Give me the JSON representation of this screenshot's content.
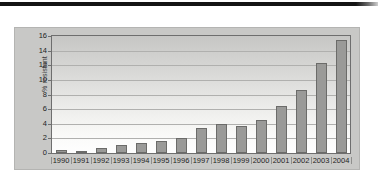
{
  "figure": {
    "panel_bg": "#c8c8c6",
    "bar_fill": "#9a9a98",
    "bar_stroke": "#6b6b69",
    "frame_stroke": "#6e6e6e",
    "grid_color": "#b0b0ae",
    "rule_color": "#141414"
  },
  "chart_data": {
    "type": "bar",
    "title": "",
    "xlabel": "",
    "ylabel": "% resistant",
    "categories": [
      "1990",
      "1991",
      "1992",
      "1993",
      "1994",
      "1995",
      "1996",
      "1997",
      "1998",
      "1999",
      "2000",
      "2001",
      "2002",
      "2003",
      "2004"
    ],
    "values": [
      0.4,
      0.3,
      0.65,
      1.15,
      1.4,
      1.6,
      2.1,
      3.4,
      3.9,
      3.75,
      4.5,
      6.4,
      8.6,
      12.3,
      15.4
    ],
    "ylim": [
      0,
      16
    ],
    "yticks": [
      0,
      2,
      4,
      6,
      8,
      10,
      12,
      14,
      16
    ],
    "ytick_labels": [
      "0",
      "2",
      "4",
      "6",
      "8",
      "10",
      "12",
      "14",
      "16"
    ],
    "grid": "horizontal",
    "legend": "none",
    "series_name": "% resistant"
  }
}
